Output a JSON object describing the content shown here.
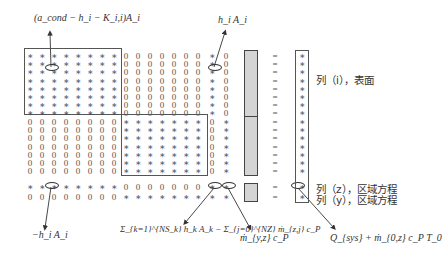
{
  "diagram": {
    "type": "sparse-matrix-equation",
    "matrix": {
      "columns": 17,
      "rows": 17,
      "blocks": [
        {
          "name": "surface-block",
          "rows": [
            1,
            8
          ],
          "cols": [
            1,
            8
          ],
          "fill": "*"
        },
        {
          "name": "surface-block-2",
          "rows": [
            9,
            15
          ],
          "cols": [
            9,
            15
          ],
          "fill": "*"
        }
      ],
      "row_patterns": {
        "top": "********0000000*0",
        "middle": "00000000*******0*",
        "zone_z": "********0000000**",
        "zone_y": "00000000*******+*"
      }
    },
    "annotations": {
      "diag_term": "(a_cond − h_i − K_i,i)A_i",
      "offdiag_term": "h_i A_i",
      "neg_term": "−h_i A_i",
      "sum_term": "Σ_{k=1}^{NS_k} h_k A_k − Σ_{j=0}^{NZ} ṁ_{z,j} c_P",
      "flow_term": "ṁ_{y,z} c_P",
      "rhs_term": "Q_{sys} + ṁ_{0,z} c_P T_0"
    },
    "labels": {
      "surface": "列（i），表面",
      "zone_z": "列（z），区域方程",
      "zone_y": "列（y），区域方程"
    },
    "equals_count": 17,
    "colors": {
      "vector_fill": "#d4d4d4",
      "line": "#444444"
    }
  }
}
